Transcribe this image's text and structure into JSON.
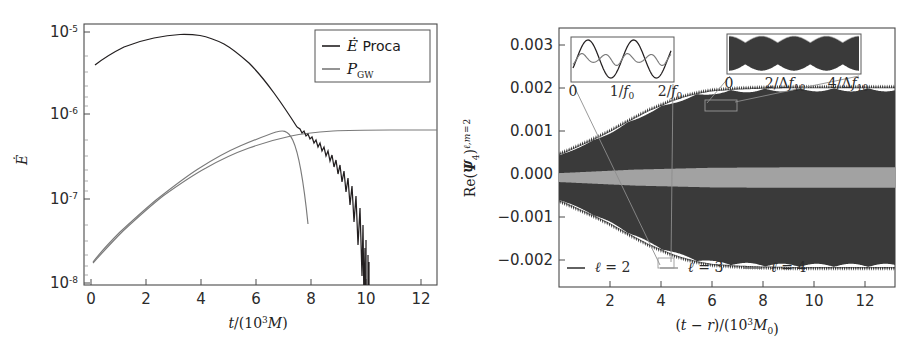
{
  "figure": {
    "title": "",
    "panels": [
      "energy-flux-panel",
      "psi4-waveform-panel"
    ]
  },
  "left_panel": {
    "ylabel": "Ė",
    "xlabel_main": "t/(10",
    "xlabel_exp": "3",
    "xlabel_tail": "M)",
    "xlabel_full": "t/(10³M)",
    "ytick_base": "10",
    "yticks": [
      "10⁻⁵",
      "10⁻⁶",
      "10⁻⁷",
      "10⁻⁸"
    ],
    "yexps": [
      "-5",
      "-6",
      "-7",
      "-8"
    ],
    "xticks": [
      "0",
      "2",
      "4",
      "6",
      "8",
      "10",
      "12"
    ],
    "legend": [
      {
        "label_italic": "Ė",
        "label_rest": " Proca",
        "label": "Ė Proca",
        "color": "#231f20",
        "name": "edot-proca"
      },
      {
        "label_italic": "P",
        "label_sub": "GW",
        "label": "P_GW",
        "color": "#7a7a7a",
        "name": "p-gw"
      }
    ]
  },
  "right_panel": {
    "ylabel_main": "Re(Ψ",
    "ylabel_sub1": "4",
    "ylabel_mid": ")",
    "ylabel_sup": "ℓ,m = 2",
    "ylabel_full": "Re(Ψ₄)^{ℓ,m=2}",
    "xlabel_full": "(t − r)/(10³M₀)",
    "yticks": [
      "0.003",
      "0.002",
      "0.001",
      "0.000",
      "−0.001",
      "−0.002"
    ],
    "ytick_values": [
      0.003,
      0.002,
      0.001,
      0.0,
      -0.001,
      -0.002
    ],
    "xticks": [
      "2",
      "4",
      "6",
      "8",
      "10",
      "12"
    ],
    "xtick_values": [
      2,
      4,
      6,
      8,
      10,
      12
    ],
    "legend": [
      {
        "label": "ℓ = 2",
        "color": "#2e2e2e",
        "name": "ell-2"
      },
      {
        "label": "ℓ = 3",
        "color": "#9a9a9a",
        "name": "ell-3"
      },
      {
        "label": "ℓ = 4",
        "color": "#6f6f6f",
        "name": "ell-4"
      }
    ],
    "inset_left": {
      "name": "inset-oscillation-f0",
      "ticks": [
        "0",
        "1/f₀",
        "2/f₀"
      ]
    },
    "inset_right": {
      "name": "inset-beating-df10",
      "ticks": [
        "0",
        "2/Δf₁₀",
        "4/Δf₁₀"
      ]
    }
  },
  "colors": {
    "dark": "#231f20",
    "gray": "#7a7a7a",
    "light_gray": "#9a9a9a",
    "axis": "#4a4a4a",
    "background": "#ffffff"
  },
  "chart_data": [
    {
      "type": "line",
      "name": "energy-flux-vs-time",
      "title": "",
      "xlabel": "t/(10³M)",
      "ylabel": "Ė",
      "yscale": "log",
      "xlim": [
        0,
        12.9
      ],
      "ylim": [
        1e-08,
        2.2e-05
      ],
      "grid": false,
      "legend_position": "top-right",
      "xticks": [
        0,
        2,
        4,
        6,
        8,
        10,
        12
      ],
      "yticks": [
        1e-05,
        1e-06,
        1e-07,
        1e-08
      ],
      "series": [
        {
          "name": "Ė Proca",
          "color": "#231f20",
          "x": [
            0.4,
            0.8,
            1.2,
            1.6,
            2.0,
            2.4,
            2.8,
            3.1,
            3.5,
            4.0,
            4.5,
            5.0,
            5.5,
            6.0,
            6.5,
            7.0,
            7.5,
            8.0,
            8.3,
            8.6,
            8.8,
            8.9,
            9.0,
            9.05
          ],
          "y": [
            5.1e-06,
            6.4e-06,
            7.6e-06,
            8.6e-06,
            9.2e-06,
            9.6e-06,
            9.75e-06,
            9.7e-06,
            9.2e-06,
            8e-06,
            6.5e-06,
            5e-06,
            3.6e-06,
            2.5e-06,
            1.75e-06,
            1.25e-06,
            9.5e-07,
            7.2e-07,
            6e-07,
            4.6e-07,
            3e-07,
            1.4e-07,
            3e-08,
            1e-08
          ],
          "note": "smooth rise to peak ~9.8e-6 near t=3, then decay with growing high-frequency oscillation, plunging below 1e-8 at t≈9"
        },
        {
          "name": "P_GW",
          "color": "#7a7a7a",
          "x": [
            0.35,
            0.8,
            1.4,
            2.0,
            2.6,
            3.2,
            3.8,
            4.4,
            5.0,
            5.6,
            6.2,
            6.8,
            7.4,
            8.0,
            8.6,
            9.4,
            10.4,
            11.4,
            12.4,
            12.9
          ],
          "y": [
            2.7e-08,
            4.2e-08,
            6.6e-08,
            9.6e-08,
            1.32e-07,
            1.74e-07,
            2.2e-07,
            2.68e-07,
            3.15e-07,
            3.6e-07,
            3.98e-07,
            4.3e-07,
            4.55e-07,
            4.72e-07,
            4.82e-07,
            4.88e-07,
            4.9e-07,
            4.9e-07,
            4.9e-07,
            4.9e-07
          ],
          "note": "monotonic rise saturating at ~4.9e-7"
        }
      ]
    },
    {
      "type": "line",
      "name": "psi4-real-part-waveform",
      "title": "",
      "xlabel": "(t − r)/(10³M₀)",
      "ylabel": "Re(Ψ₄)^{ℓ,m=2}",
      "yscale": "linear",
      "xlim": [
        0,
        13.2
      ],
      "ylim": [
        -0.00245,
        0.00335
      ],
      "grid": false,
      "legend_position": "bottom-inside",
      "xticks": [
        2,
        4,
        6,
        8,
        10,
        12
      ],
      "yticks": [
        0.003,
        0.002,
        0.001,
        0.0,
        -0.001,
        -0.002
      ],
      "series": [
        {
          "name": "ℓ = 2",
          "color": "#2e2e2e",
          "description": "rapid oscillation filling band; envelope grows from ±0.0005 at x=0 to ±0.0020 saturating near x=6",
          "envelope_x": [
            0,
            0.5,
            1.0,
            1.5,
            2.0,
            2.5,
            3.0,
            3.5,
            4.0,
            4.5,
            5.0,
            5.5,
            6.0,
            7.0,
            8.0,
            9.0,
            10.0,
            11.0,
            12.0,
            13.2
          ],
          "envelope_y": [
            0.0005,
            0.00062,
            0.00075,
            0.00088,
            0.00102,
            0.00118,
            0.00133,
            0.00148,
            0.0016,
            0.00172,
            0.00181,
            0.00188,
            0.00193,
            0.00197,
            0.00199,
            0.002,
            0.002,
            0.002,
            0.002,
            0.002
          ]
        },
        {
          "name": "ℓ = 3",
          "color": "#9a9a9a",
          "description": "low amplitude band near zero, envelope ~±0.00022",
          "envelope_x": [
            0,
            3,
            6,
            9,
            13.2
          ],
          "envelope_y": [
            0.0001,
            0.00018,
            0.00022,
            0.00023,
            0.00023
          ]
        },
        {
          "name": "ℓ = 4",
          "color": "#6f6f6f",
          "description": "very low amplitude band near zero, envelope ~±0.00008",
          "envelope_x": [
            0,
            3,
            6,
            9,
            13.2
          ],
          "envelope_y": [
            4e-05,
            6e-05,
            8e-05,
            8e-05,
            8e-05
          ]
        }
      ],
      "insets": [
        {
          "name": "inset-oscillation-f0",
          "xticks": [
            "0",
            "1/f₀",
            "2/f₀"
          ],
          "description": "zoom on two fundamental periods showing large ℓ=2 sinusoid and smaller superposed modes"
        },
        {
          "name": "inset-beating-df10",
          "xticks": [
            "0",
            "2/Δf₁₀",
            "4/Δf₁₀"
          ],
          "description": "zoom on envelope beating pattern over four beat periods"
        }
      ]
    }
  ]
}
